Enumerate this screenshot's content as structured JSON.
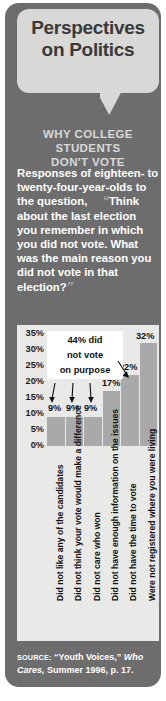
{
  "header": {
    "title_line1": "Perspectives",
    "title_line2": "on Politics",
    "kicker_line1": "WHY COLLEGE STUDENTS",
    "kicker_line2": "DON'T VOTE"
  },
  "intro": {
    "lead": "Responses of eighteen- to twenty-four-year-olds to the question,",
    "quote_open": "“",
    "quote": "Think about the last election you remember in which you did not vote. What was the main reason you did not vote in that election?",
    "quote_close": "”"
  },
  "callout": {
    "line1": "44% did",
    "line2": "not vote",
    "line3": "on purpose"
  },
  "source": {
    "label": "SOURCE:",
    "title": "“Youth Voices,”",
    "publication": "Who Cares,",
    "rest": "Summer 1996, p. 17."
  },
  "colors": {
    "card": "#6d6d6d",
    "bubble": "#d8d8d6",
    "panel": "#e9e9e7",
    "bar": "#a9a9a9",
    "text_light": "#ffffff",
    "text_dark": "#1b1b1b"
  },
  "chart_data": {
    "type": "bar",
    "title": "Why college students don't vote",
    "xlabel": "",
    "ylabel": "",
    "ylim": [
      0,
      35
    ],
    "grid": false,
    "legend": "none",
    "ticks": [
      "35%",
      "30%",
      "25%",
      "20%",
      "15%",
      "10%",
      "5%",
      "0%"
    ],
    "tick_values": [
      35,
      30,
      25,
      20,
      15,
      10,
      5,
      0
    ],
    "categories": [
      "Did not like any of the candidates",
      "Did not think your vote would make a difference",
      "Did not care who won",
      "Did not have enough information on the issues",
      "Did not have the time to vote",
      "Were not registered where you were living"
    ],
    "values": [
      9,
      9,
      9,
      17,
      22,
      32
    ],
    "data_labels": [
      "9%",
      "9%",
      "9%",
      "17%",
      "22%",
      "32%"
    ],
    "annotation": "44% did not vote on purpose",
    "annotation_targets": [
      0,
      1,
      2,
      3
    ]
  }
}
